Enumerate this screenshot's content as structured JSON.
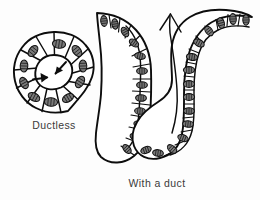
{
  "figure": {
    "background_color": "#fdfdfd",
    "ink_color": "#0d0d0d",
    "nucleus_color": "#6e6e6e",
    "caption_color": "#3a3a3a"
  },
  "captions": {
    "ductless": "Ductless",
    "with_duct": "With a duct"
  },
  "ductless_gland": {
    "label": "Ductless",
    "center_x": 54,
    "center_y": 72,
    "outer_radius": 40,
    "lumen_radius": 17,
    "cell_count": 12,
    "arrows_inward": 2,
    "arrow_labels": [
      "secretion-arrow-upper",
      "secretion-arrow-lower"
    ]
  },
  "duct_gland": {
    "label": "With a duct",
    "shape": "U-shaped tube",
    "wall_cell_count_left": 12,
    "wall_cell_count_right": 12,
    "flow_arrow_direction": "up",
    "flow_arrow_label": "duct-flow-arrow"
  }
}
